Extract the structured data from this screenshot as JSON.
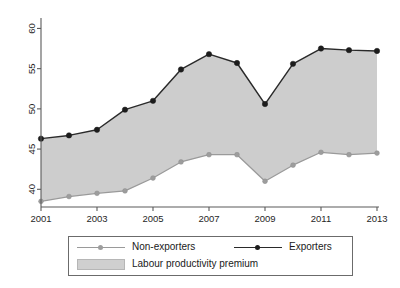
{
  "chart_data": {
    "type": "line",
    "title": "",
    "subtitle": "",
    "xlabel": "",
    "ylabel": "",
    "x": [
      2001,
      2002,
      2003,
      2004,
      2005,
      2006,
      2007,
      2008,
      2009,
      2010,
      2011,
      2012,
      2013
    ],
    "xtick_labels": [
      "2001",
      "2003",
      "2005",
      "2007",
      "2009",
      "2011",
      "2013"
    ],
    "xticks": [
      2001,
      2003,
      2005,
      2007,
      2009,
      2011,
      2013
    ],
    "xlim": [
      2001,
      2013
    ],
    "ytick_labels": [
      "40",
      "45",
      "50",
      "55",
      "60"
    ],
    "yticks": [
      40,
      45,
      50,
      55,
      60
    ],
    "ylim": [
      37.8,
      60.8
    ],
    "grid": false,
    "legend_position": "below-plot",
    "series": [
      {
        "name": "Exporters",
        "color": "#2a2a2a",
        "marker": "filled-circle",
        "values": [
          46.3,
          46.7,
          47.4,
          49.9,
          51.0,
          54.9,
          56.8,
          55.7,
          50.6,
          55.6,
          57.5,
          57.3,
          57.2
        ]
      },
      {
        "name": "Non-exporters",
        "color": "#9a9a9a",
        "marker": "filled-circle",
        "values": [
          38.5,
          39.1,
          39.5,
          39.8,
          41.4,
          43.4,
          44.3,
          44.3,
          41.0,
          43.0,
          44.6,
          44.3,
          44.5
        ]
      }
    ],
    "band": {
      "name": "Labour productivity premium",
      "color": "#c9c9c9",
      "between": [
        "Non-exporters",
        "Exporters"
      ]
    }
  },
  "legend": {
    "nonexporters_label": "Non-exporters",
    "exporters_label": "Exporters",
    "band_label": "Labour productivity premium"
  }
}
